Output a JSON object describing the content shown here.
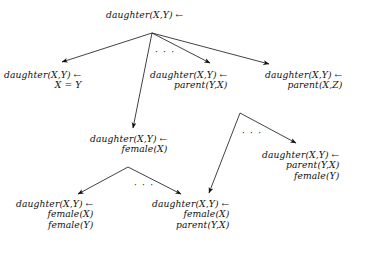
{
  "figure": {
    "type": "refinement-graph",
    "width": 386,
    "height": 258,
    "background_color": "#ffffff",
    "ink_color": "#111111"
  },
  "nodes": [
    {
      "id": "root",
      "name": "node-root",
      "lines": [
        "daughter(X,Y) ←"
      ],
      "x": 106,
      "y": 10,
      "align": "center"
    },
    {
      "id": "n-equal",
      "name": "node-x-equals-y",
      "lines": [
        "daughter(X,Y) ←",
        "X = Y"
      ],
      "x": 4,
      "y": 70,
      "align": "right"
    },
    {
      "id": "n-parent-yx",
      "name": "node-parent-y-x",
      "lines": [
        "daughter(X,Y) ←",
        "parent(Y,X)"
      ],
      "x": 150,
      "y": 70,
      "align": "right"
    },
    {
      "id": "n-parent-xz",
      "name": "node-parent-x-z",
      "lines": [
        "daughter(X,Y) ←",
        "parent(X,Z)"
      ],
      "x": 265,
      "y": 70,
      "align": "right"
    },
    {
      "id": "n-female-x",
      "name": "node-female-x",
      "lines": [
        "daughter(X,Y) ←",
        "female(X)"
      ],
      "x": 90,
      "y": 134,
      "align": "right"
    },
    {
      "id": "n-parent-yx-female-y",
      "name": "node-parent-y-x-female-y",
      "lines": [
        "daughter(X,Y) ←",
        "parent(Y,X)",
        "female(Y)"
      ],
      "x": 262,
      "y": 150,
      "align": "right"
    },
    {
      "id": "n-female-x-female-y",
      "name": "node-female-x-female-y",
      "lines": [
        "daughter(X,Y) ←",
        "female(X)",
        "female(Y)"
      ],
      "x": 16,
      "y": 199,
      "align": "right"
    },
    {
      "id": "n-female-x-parent-yx",
      "name": "node-female-x-parent-y-x",
      "lines": [
        "daughter(X,Y) ←",
        "female(X)",
        "parent(Y,X)"
      ],
      "x": 152,
      "y": 199,
      "align": "right"
    }
  ],
  "edges": [
    {
      "name": "edge-root-to-x-equals-y",
      "from": [
        152,
        33
      ],
      "to": [
        62,
        62
      ]
    },
    {
      "name": "edge-root-to-female-x",
      "from": [
        152,
        33
      ],
      "to": [
        133,
        128
      ]
    },
    {
      "name": "edge-root-to-parent-y-x",
      "from": [
        152,
        33
      ],
      "to": [
        210,
        63
      ]
    },
    {
      "name": "edge-root-to-parent-x-z",
      "from": [
        152,
        33
      ],
      "to": [
        269,
        64
      ]
    },
    {
      "name": "edge-parent-x-z-to-female-x-parent-y-x",
      "from": [
        240,
        113
      ],
      "to": [
        209,
        193
      ]
    },
    {
      "name": "edge-parent-x-z-to-parent-y-x-female-y",
      "from": [
        240,
        113
      ],
      "to": [
        296,
        143
      ]
    },
    {
      "name": "edge-female-x-to-female-x-female-y",
      "from": [
        128,
        167
      ],
      "to": [
        78,
        194
      ]
    },
    {
      "name": "edge-female-x-to-female-x-parent-y-x",
      "from": [
        128,
        167
      ],
      "to": [
        181,
        194
      ]
    }
  ],
  "ellipses": [
    {
      "name": "ellipsis-root-children",
      "text": "· · ·",
      "x": 155,
      "y": 47
    },
    {
      "name": "ellipsis-parent-x-z-children",
      "text": "· · ·",
      "x": 242,
      "y": 128
    },
    {
      "name": "ellipsis-female-x-children",
      "text": "· · ·",
      "x": 134,
      "y": 180
    }
  ]
}
